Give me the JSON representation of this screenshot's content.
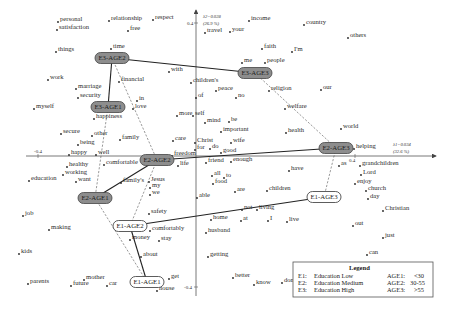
{
  "chart_data": {
    "type": "scatter",
    "title": "",
    "subtype": "correspondence analysis biplot",
    "xlabel": "λ1=0.034 (32.6 %)",
    "ylabel": "λ2=0.028 (26.9 %)",
    "x_axis": {
      "label_line1": "λ1=0.034",
      "label_line2": "(32.6 %)",
      "ticks": [
        "-0.4",
        "0.4"
      ],
      "xlim": [
        -0.45,
        0.5
      ]
    },
    "y_axis": {
      "label_line1": "λ2=0.028",
      "label_line2": "(26.9 %)",
      "ticks": [
        "0.4",
        "-0.4"
      ],
      "ylim": [
        -0.45,
        0.45
      ]
    },
    "grid": false,
    "legend_position": "bottom-right",
    "origin_px": [
      196,
      156
    ],
    "words": [
      {
        "t": "personal",
        "x": 60,
        "y": 21
      },
      {
        "t": "satisfaction",
        "x": 59,
        "y": 29
      },
      {
        "t": "relationship",
        "x": 111,
        "y": 20
      },
      {
        "t": "free",
        "x": 130,
        "y": 30
      },
      {
        "t": "respect",
        "x": 155,
        "y": 19
      },
      {
        "t": "travel",
        "x": 207,
        "y": 32
      },
      {
        "t": "your",
        "x": 232,
        "y": 31
      },
      {
        "t": "income",
        "x": 251,
        "y": 20
      },
      {
        "t": "country",
        "x": 306,
        "y": 24
      },
      {
        "t": "others",
        "x": 350,
        "y": 37
      },
      {
        "t": "things",
        "x": 58,
        "y": 51
      },
      {
        "t": "time",
        "x": 113,
        "y": 48
      },
      {
        "t": "faith",
        "x": 264,
        "y": 48
      },
      {
        "t": "I'm",
        "x": 294,
        "y": 51
      },
      {
        "t": "me",
        "x": 244,
        "y": 62
      },
      {
        "t": "people",
        "x": 267,
        "y": 62
      },
      {
        "t": "with",
        "x": 171,
        "y": 71
      },
      {
        "t": "work",
        "x": 50,
        "y": 79
      },
      {
        "t": "financial",
        "x": 121,
        "y": 81
      },
      {
        "t": "children's",
        "x": 193,
        "y": 82
      },
      {
        "t": "peace",
        "x": 218,
        "y": 90
      },
      {
        "t": "religion",
        "x": 271,
        "y": 90
      },
      {
        "t": "our",
        "x": 323,
        "y": 89
      },
      {
        "t": "marriage",
        "x": 78,
        "y": 88
      },
      {
        "t": "security",
        "x": 80,
        "y": 97
      },
      {
        "t": "of",
        "x": 198,
        "y": 97
      },
      {
        "t": "no",
        "x": 238,
        "y": 97
      },
      {
        "t": "myself",
        "x": 36,
        "y": 108
      },
      {
        "t": "in",
        "x": 139,
        "y": 100
      },
      {
        "t": "love",
        "x": 135,
        "y": 108
      },
      {
        "t": "welfare",
        "x": 287,
        "y": 108
      },
      {
        "t": "happiness",
        "x": 96,
        "y": 118
      },
      {
        "t": "more",
        "x": 179,
        "y": 115
      },
      {
        "t": "self",
        "x": 195,
        "y": 115
      },
      {
        "t": "mind",
        "x": 207,
        "y": 122
      },
      {
        "t": "be",
        "x": 231,
        "y": 121
      },
      {
        "t": "important",
        "x": 223,
        "y": 131
      },
      {
        "t": "health",
        "x": 288,
        "y": 132
      },
      {
        "t": "world",
        "x": 343,
        "y": 128
      },
      {
        "t": "secure",
        "x": 63,
        "y": 133
      },
      {
        "t": "other",
        "x": 94,
        "y": 135
      },
      {
        "t": "family",
        "x": 122,
        "y": 139
      },
      {
        "t": "care",
        "x": 175,
        "y": 140
      },
      {
        "t": "Christ",
        "x": 197,
        "y": 142
      },
      {
        "t": "wife",
        "x": 233,
        "y": 142
      },
      {
        "t": "being",
        "x": 80,
        "y": 144
      },
      {
        "t": "for",
        "x": 197,
        "y": 149
      },
      {
        "t": "do",
        "x": 212,
        "y": 148
      },
      {
        "t": "good",
        "x": 223,
        "y": 152
      },
      {
        "t": "helping",
        "x": 356,
        "y": 148
      },
      {
        "t": "happy",
        "x": 71,
        "y": 154
      },
      {
        "t": "well",
        "x": 98,
        "y": 154
      },
      {
        "t": "freedom",
        "x": 174,
        "y": 155
      },
      {
        "t": "healthy",
        "x": 69,
        "y": 166
      },
      {
        "t": "comfortable",
        "x": 106,
        "y": 164
      },
      {
        "t": "life",
        "x": 180,
        "y": 165
      },
      {
        "t": "friend",
        "x": 208,
        "y": 162
      },
      {
        "t": "enough",
        "x": 233,
        "y": 161
      },
      {
        "t": "as",
        "x": 341,
        "y": 165
      },
      {
        "t": "grandchildren",
        "x": 362,
        "y": 165
      },
      {
        "t": "education",
        "x": 31,
        "y": 180
      },
      {
        "t": "working",
        "x": 65,
        "y": 174
      },
      {
        "t": "want",
        "x": 78,
        "y": 181
      },
      {
        "t": "family's",
        "x": 123,
        "y": 182
      },
      {
        "t": "Jesus",
        "x": 151,
        "y": 181
      },
      {
        "t": "my",
        "x": 152,
        "y": 187
      },
      {
        "t": "we",
        "x": 152,
        "y": 194
      },
      {
        "t": "all",
        "x": 214,
        "y": 175
      },
      {
        "t": "to",
        "x": 226,
        "y": 177
      },
      {
        "t": "food",
        "x": 215,
        "y": 183
      },
      {
        "t": "have",
        "x": 291,
        "y": 170
      },
      {
        "t": "Lord",
        "x": 363,
        "y": 174
      },
      {
        "t": "enjoy",
        "x": 357,
        "y": 183
      },
      {
        "t": "are",
        "x": 237,
        "y": 191
      },
      {
        "t": "children",
        "x": 269,
        "y": 190
      },
      {
        "t": "church",
        "x": 368,
        "y": 190
      },
      {
        "t": "day",
        "x": 370,
        "y": 198
      },
      {
        "t": "able",
        "x": 199,
        "y": 197
      },
      {
        "t": "not",
        "x": 244,
        "y": 209
      },
      {
        "t": "living",
        "x": 259,
        "y": 209
      },
      {
        "t": "Christian",
        "x": 385,
        "y": 210
      },
      {
        "t": "job",
        "x": 25,
        "y": 215
      },
      {
        "t": "safety",
        "x": 151,
        "y": 213
      },
      {
        "t": "home",
        "x": 213,
        "y": 219
      },
      {
        "t": "at",
        "x": 243,
        "y": 220
      },
      {
        "t": "I",
        "x": 270,
        "y": 220
      },
      {
        "t": "live",
        "x": 289,
        "y": 221
      },
      {
        "t": "making",
        "x": 51,
        "y": 229
      },
      {
        "t": "comfortably",
        "x": 152,
        "y": 230
      },
      {
        "t": "husband",
        "x": 208,
        "y": 232
      },
      {
        "t": "money",
        "x": 132,
        "y": 239
      },
      {
        "t": "stay",
        "x": 161,
        "y": 240
      },
      {
        "t": "out",
        "x": 355,
        "y": 225
      },
      {
        "t": "just",
        "x": 385,
        "y": 237
      },
      {
        "t": "kids",
        "x": 21,
        "y": 253
      },
      {
        "t": "about",
        "x": 143,
        "y": 256
      },
      {
        "t": "getting",
        "x": 210,
        "y": 256
      },
      {
        "t": "can",
        "x": 369,
        "y": 254
      },
      {
        "t": "parents",
        "x": 30,
        "y": 283
      },
      {
        "t": "mother",
        "x": 86,
        "y": 279
      },
      {
        "t": "future",
        "x": 73,
        "y": 285
      },
      {
        "t": "car",
        "x": 109,
        "y": 285
      },
      {
        "t": "get",
        "x": 171,
        "y": 278
      },
      {
        "t": "house",
        "x": 159,
        "y": 290
      },
      {
        "t": "better",
        "x": 235,
        "y": 277
      },
      {
        "t": "know",
        "x": 256,
        "y": 284
      },
      {
        "t": "don't",
        "x": 284,
        "y": 282
      }
    ],
    "nodes": [
      {
        "id": "E3-AGE2",
        "x": 112,
        "y": 58,
        "style": "dark"
      },
      {
        "id": "E3-AGE3",
        "x": 255,
        "y": 73,
        "style": "dark"
      },
      {
        "id": "E3-AGE1",
        "x": 108,
        "y": 107,
        "style": "dark"
      },
      {
        "id": "E2-AGE2",
        "x": 157,
        "y": 160,
        "style": "dark"
      },
      {
        "id": "E2-AGE3",
        "x": 336,
        "y": 148,
        "style": "dark"
      },
      {
        "id": "E2-AGE1",
        "x": 95,
        "y": 198,
        "style": "dark"
      },
      {
        "id": "E1-AGE2",
        "x": 130,
        "y": 226,
        "style": "light"
      },
      {
        "id": "E1-AGE3",
        "x": 324,
        "y": 197,
        "style": "light"
      },
      {
        "id": "E1-AGE1",
        "x": 147,
        "y": 282,
        "style": "light"
      }
    ],
    "solid_links": [
      [
        "E3-AGE2",
        "E3-AGE3"
      ],
      [
        "E3-AGE2",
        "E3-AGE1"
      ],
      [
        "E2-AGE2",
        "E2-AGE3"
      ],
      [
        "E2-AGE2",
        "E2-AGE1"
      ],
      [
        "E1-AGE2",
        "E1-AGE3"
      ],
      [
        "E1-AGE2",
        "E1-AGE1"
      ]
    ],
    "dashed_links": [
      [
        "E3-AGE2",
        "E2-AGE2"
      ],
      [
        "E3-AGE1",
        "E2-AGE1"
      ],
      [
        "E3-AGE3",
        "E2-AGE3"
      ],
      [
        "E2-AGE2",
        "E1-AGE2"
      ],
      [
        "E2-AGE1",
        "E1-AGE1"
      ],
      [
        "E2-AGE3",
        "E1-AGE3"
      ]
    ]
  },
  "legend": {
    "title": "Legend",
    "rows": [
      {
        "code": "E1:",
        "label": "Education Low",
        "age_code": "AGE1:",
        "age_range": "<30"
      },
      {
        "code": "E2:",
        "label": "Education Medium",
        "age_code": "AGE2:",
        "age_range": "30-55"
      },
      {
        "code": "E3:",
        "label": "Education High",
        "age_code": "AGE3:",
        "age_range": ">55"
      }
    ]
  }
}
